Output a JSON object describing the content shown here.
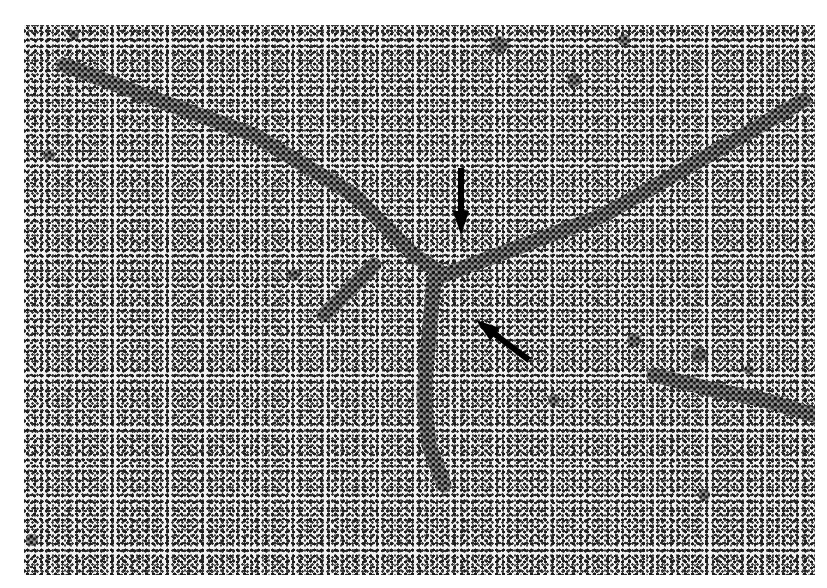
{
  "image": {
    "kind": "electron-micrograph",
    "description": "Branched DNA molecule with a three-way junction; two black arrows point at the branch point",
    "colors": {
      "background": "#f2f2f2",
      "grain": "#222222",
      "strand": "#1a1a1a",
      "arrow": "#000000"
    },
    "strands": [
      {
        "name": "upper-left-arm",
        "points": [
          [
            40,
            40
          ],
          [
            120,
            70
          ],
          [
            230,
            110
          ],
          [
            330,
            170
          ],
          [
            390,
            230
          ],
          [
            420,
            250
          ]
        ]
      },
      {
        "name": "right-arm",
        "points": [
          [
            420,
            250
          ],
          [
            500,
            220
          ],
          [
            580,
            190
          ],
          [
            650,
            150
          ],
          [
            720,
            110
          ],
          [
            780,
            75
          ]
        ]
      },
      {
        "name": "lower-stem",
        "points": [
          [
            410,
            255
          ],
          [
            405,
            310
          ],
          [
            400,
            370
          ],
          [
            405,
            420
          ],
          [
            420,
            460
          ]
        ]
      },
      {
        "name": "short-left-spur",
        "points": [
          [
            350,
            240
          ],
          [
            320,
            270
          ],
          [
            300,
            290
          ]
        ]
      },
      {
        "name": "lower-right-fragment",
        "points": [
          [
            630,
            350
          ],
          [
            690,
            365
          ],
          [
            740,
            375
          ],
          [
            790,
            390
          ]
        ]
      }
    ],
    "arrows": [
      {
        "name": "arrow-vertical",
        "from": [
          437,
          143
        ],
        "to": [
          437,
          210
        ]
      },
      {
        "name": "arrow-diagonal",
        "from": [
          505,
          335
        ],
        "to": [
          452,
          295
        ]
      }
    ]
  }
}
